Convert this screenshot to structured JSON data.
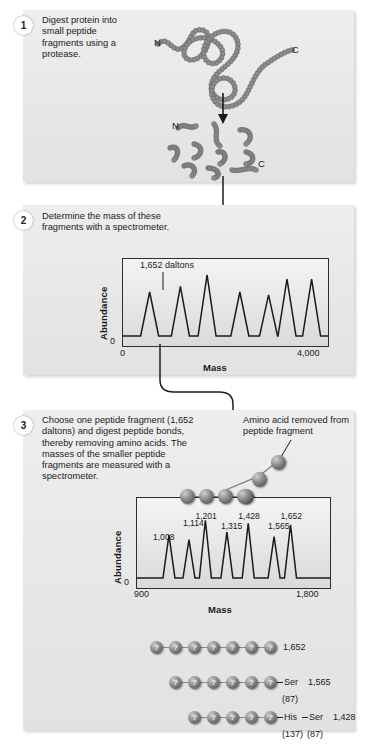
{
  "figure": {
    "panel_bg": "#e8e8e8",
    "ink": "#1b1b1b"
  },
  "steps": [
    {
      "number": "1",
      "text": "Digest protein into small peptide fragments using a protease.",
      "terminus_labels": {
        "n_top": "N",
        "c_top": "C",
        "n_bottom": "N",
        "c_bottom": "C"
      }
    },
    {
      "number": "2",
      "text": "Determine the mass of these fragments with a spectrometer."
    },
    {
      "number": "3",
      "text": "Choose one peptide fragment (1,652 daltons) and digest peptide bonds, thereby removing amino acids. The masses of the smaller peptide fragments are measured with a spectrometer.",
      "annotation": "Amino acid removed from peptide fragment"
    }
  ],
  "chart_data": [
    {
      "type": "line",
      "id": "spectrum-whole-digest",
      "title": "",
      "xlabel": "Mass",
      "ylabel": "Abundance",
      "xlim": [
        0,
        4000
      ],
      "xticks": [
        "0",
        "4,000"
      ],
      "yticks": [
        "0"
      ],
      "grid": false,
      "legend": "none",
      "annotation": "1,652 daltons",
      "annotated_peak_index": 1,
      "peak_positions": [
        11,
        26,
        38,
        55,
        69,
        86
      ],
      "x": [
        11,
        26,
        38,
        55,
        69,
        86
      ],
      "values": [
        62,
        70,
        86,
        62,
        58,
        80
      ],
      "note": "Seven-peak mass spectrum of total peptide digest; peak 2 marked 1,652 daltons"
    },
    {
      "type": "line",
      "id": "spectrum-ladder",
      "title": "",
      "xlabel": "Mass",
      "ylabel": "Abundance",
      "xlim": [
        900,
        1800
      ],
      "xticks": [
        "900",
        "1,800"
      ],
      "yticks": [
        "0"
      ],
      "grid": false,
      "legend": "none",
      "categories": [
        "1,008",
        "1,114",
        "1,201",
        "1,315",
        "1,428",
        "1,565",
        "1,652"
      ],
      "x": [
        1008,
        1114,
        1201,
        1315,
        1428,
        1565,
        1652
      ],
      "values": [
        58,
        52,
        78,
        62,
        74,
        56,
        72
      ],
      "peak_labels": [
        "1,008",
        "1,114",
        "1,201",
        "1,315",
        "1,428",
        "1,565",
        "1,652"
      ],
      "note": "Ladder spectrum of sequentially shortened peptide fragments"
    }
  ],
  "peptide_rows": [
    {
      "beads": 7,
      "residues": [],
      "mass": "1,652",
      "residue_masses": []
    },
    {
      "beads": 6,
      "residues": [
        "Ser"
      ],
      "mass": "1,565",
      "residue_masses": [
        "(87)"
      ]
    },
    {
      "beads": 5,
      "residues": [
        "His",
        "Ser"
      ],
      "mass": "1,428",
      "residue_masses": [
        "(137)",
        "(87)"
      ]
    }
  ],
  "bead_symbol": "?",
  "axis": {
    "mass_label": "Mass",
    "abundance_label": "Abundance",
    "zero": "0"
  }
}
